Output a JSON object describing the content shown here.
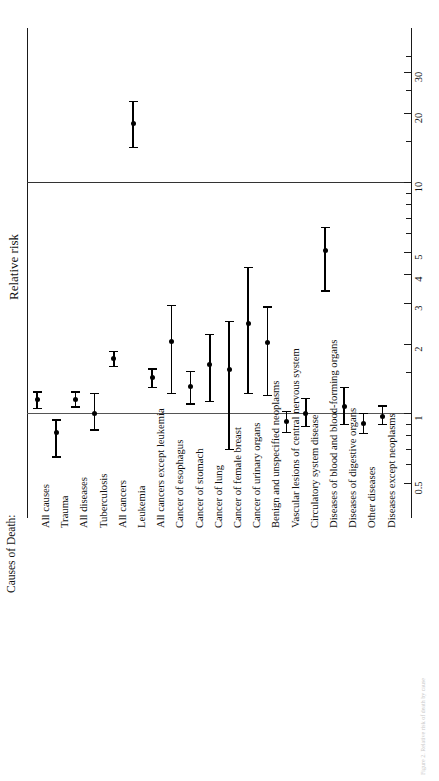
{
  "figure": {
    "value_axis_title": "Relative risk",
    "category_header": "Causes of Death:",
    "caption": "Figure 2. Relative risk of death by cause"
  },
  "chart_data": {
    "type": "scatter",
    "title": "",
    "subtitle": "",
    "orientation": "horizontal-categories-rotated",
    "xlabel": "Causes of Death:",
    "ylabel": "Relative risk",
    "scale": "log",
    "ylim": [
      0.4,
      36
    ],
    "grid": false,
    "legend": "none",
    "reference_lines": [
      1,
      10
    ],
    "tick_labels": [
      "0.5",
      "1",
      "2",
      "3",
      "4",
      "5",
      "10",
      "20",
      "30"
    ],
    "tick_values": [
      0.5,
      1,
      2,
      3,
      4,
      5,
      10,
      20,
      30
    ],
    "minor_tick_values": [
      0.6,
      0.7,
      0.8,
      0.9,
      1.5,
      6,
      7,
      8,
      9,
      15,
      25,
      35
    ],
    "categories": [
      "All causes",
      "Trauma",
      "All diseases",
      "Tuberculosis",
      "All cancers",
      "Leukemia",
      "All cancers except leukemia",
      "Cancer of esophagus",
      "Cancer of stomach",
      "Cancer of lung",
      "Cancer of female breast",
      "Cancer of urinary organs",
      "Benign and unspecified neoplasms",
      "Vascular lesions of central nervous system",
      "Circulatory system disease",
      "Diseases of blood and blood-forming organs",
      "Diseases of digestive organs",
      "Other diseases",
      "Diseases except neoplasms"
    ],
    "values": [
      1.14,
      0.82,
      1.15,
      1.0,
      1.72,
      18.0,
      1.42,
      2.05,
      1.3,
      1.62,
      1.55,
      2.45,
      2.03,
      0.92,
      1.0,
      5.05,
      1.07,
      0.9,
      0.97
    ],
    "ci_low": [
      1.05,
      0.65,
      1.07,
      0.85,
      1.6,
      14.2,
      1.3,
      1.22,
      1.1,
      1.13,
      0.7,
      1.22,
      1.2,
      0.83,
      0.88,
      3.4,
      0.9,
      0.82,
      0.9
    ],
    "ci_high": [
      1.24,
      0.94,
      1.24,
      1.22,
      1.86,
      22.5,
      1.56,
      2.95,
      1.52,
      2.2,
      2.5,
      4.3,
      2.9,
      1.02,
      1.16,
      6.4,
      1.3,
      1.0,
      1.08
    ],
    "series_name": "Relative risk with 95% confidence interval",
    "marker": "filled-circle-with-error-bars"
  },
  "colors": {
    "marker": "#000000",
    "axis": "#1a1a1a",
    "reference_line": "#555555",
    "background": "#ffffff"
  }
}
